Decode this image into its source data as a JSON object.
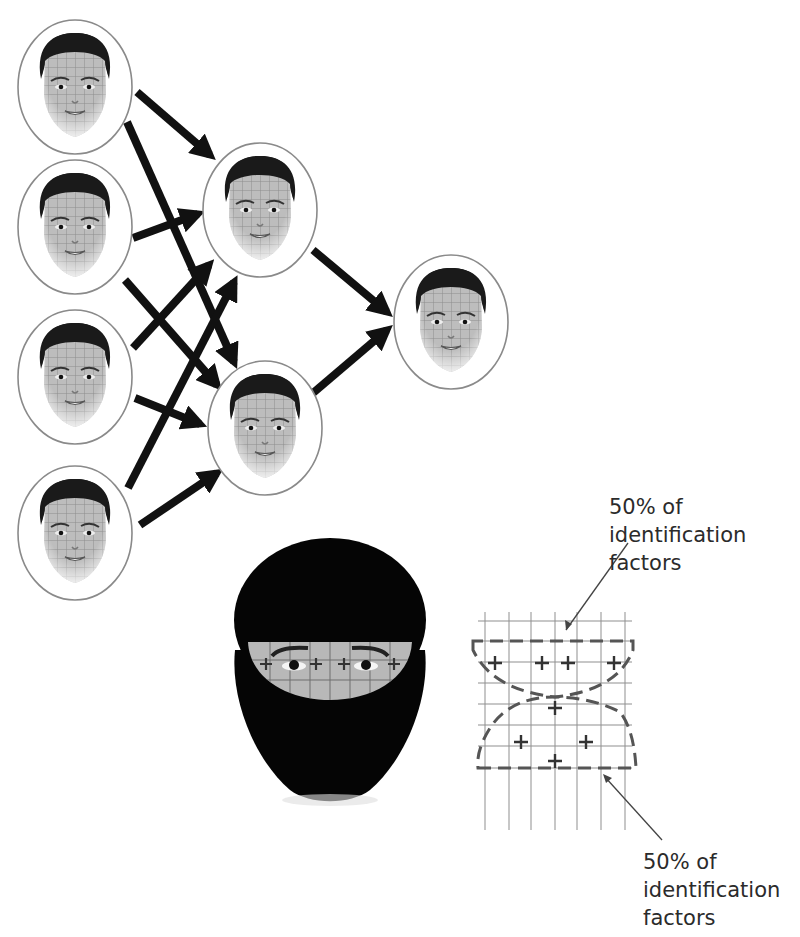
{
  "diagram": {
    "network": {
      "layers": [
        {
          "name": "input",
          "nodes": [
            {
              "id": "in1",
              "cx": 75,
              "cy": 87,
              "rx": 57,
              "ry": 67
            },
            {
              "id": "in2",
              "cx": 75,
              "cy": 227,
              "rx": 57,
              "ry": 67
            },
            {
              "id": "in3",
              "cx": 75,
              "cy": 377,
              "rx": 57,
              "ry": 67
            },
            {
              "id": "in4",
              "cx": 75,
              "cy": 533,
              "rx": 57,
              "ry": 67
            }
          ]
        },
        {
          "name": "hidden",
          "nodes": [
            {
              "id": "h1",
              "cx": 260,
              "cy": 210,
              "rx": 57,
              "ry": 67
            },
            {
              "id": "h2",
              "cx": 265,
              "cy": 428,
              "rx": 57,
              "ry": 67
            }
          ]
        },
        {
          "name": "output",
          "nodes": [
            {
              "id": "out1",
              "cx": 451,
              "cy": 322,
              "rx": 57,
              "ry": 67
            }
          ]
        }
      ],
      "connections": [
        {
          "from": "in1",
          "to": "h1",
          "x1": 137,
          "y1": 92,
          "x2": 210,
          "y2": 155
        },
        {
          "from": "in1",
          "to": "h2",
          "x1": 127,
          "y1": 122,
          "x2": 234,
          "y2": 362
        },
        {
          "from": "in2",
          "to": "h1",
          "x1": 133,
          "y1": 238,
          "x2": 198,
          "y2": 214
        },
        {
          "from": "in2",
          "to": "h2",
          "x1": 125,
          "y1": 280,
          "x2": 217,
          "y2": 385
        },
        {
          "from": "in3",
          "to": "h1",
          "x1": 133,
          "y1": 348,
          "x2": 209,
          "y2": 265
        },
        {
          "from": "in3",
          "to": "h2",
          "x1": 135,
          "y1": 398,
          "x2": 200,
          "y2": 424
        },
        {
          "from": "in4",
          "to": "h1",
          "x1": 128,
          "y1": 488,
          "x2": 234,
          "y2": 282
        },
        {
          "from": "in4",
          "to": "h2",
          "x1": 140,
          "y1": 525,
          "x2": 217,
          "y2": 473
        },
        {
          "from": "h1",
          "to": "out1",
          "x1": 313,
          "y1": 250,
          "x2": 387,
          "y2": 312
        },
        {
          "from": "h2",
          "to": "out1",
          "x1": 313,
          "y1": 393,
          "x2": 387,
          "y2": 330
        }
      ]
    },
    "masked_face": {
      "cx": 330,
      "cy": 660,
      "eye_band_plus_count": 4
    },
    "factor_grid": {
      "top_region_plus_count": 4,
      "bottom_region_plus_count": 4
    },
    "annotations": [
      {
        "id": "top",
        "lines": [
          "50% of",
          "identification",
          "factors"
        ],
        "x": 609,
        "y": 493
      },
      {
        "id": "bottom",
        "lines": [
          "50% of",
          "identification",
          "factors"
        ],
        "x": 643,
        "y": 848
      }
    ],
    "colors": {
      "arrow": "#111111",
      "node_outline": "#8a8a8a",
      "hair": "#1a1a1a",
      "skin": "#b8b8b8",
      "grid": "#8f8f8f",
      "dash": "#555555",
      "text": "#2b2b2b"
    }
  }
}
